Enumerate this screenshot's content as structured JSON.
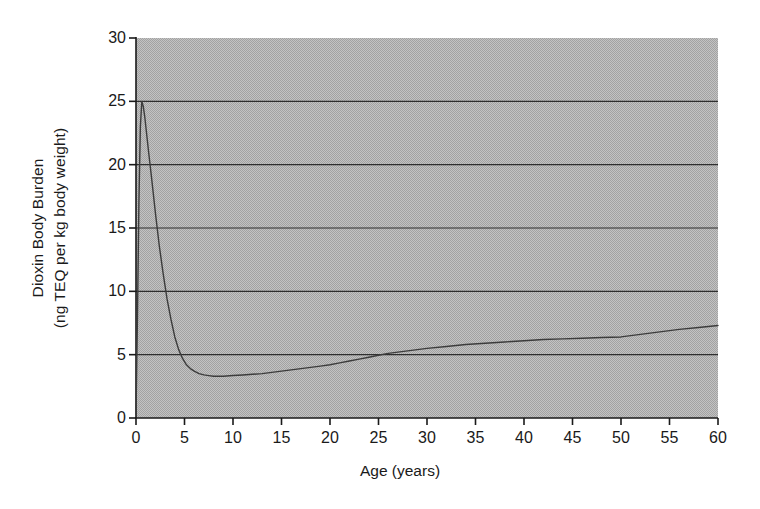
{
  "chart_data": {
    "type": "line",
    "title": "",
    "xlabel": "Age (years)",
    "ylabel_line1": "Dioxin Body Burden",
    "ylabel_line2": "(ng TEQ per kg body weight)",
    "xlim": [
      0,
      60
    ],
    "ylim": [
      0,
      30
    ],
    "xticks": [
      0,
      5,
      10,
      15,
      20,
      25,
      30,
      35,
      40,
      45,
      50,
      55,
      60
    ],
    "xtick_labels": [
      "0",
      "5",
      "10",
      "15",
      "20",
      "25",
      "30",
      "35",
      "40",
      "45",
      "50",
      "55",
      "60"
    ],
    "yticks": [
      0,
      5,
      10,
      15,
      20,
      25,
      30
    ],
    "ytick_labels": [
      "0",
      "5",
      "10",
      "15",
      "20",
      "25",
      "30"
    ],
    "gridlines": {
      "horizontal": [
        5,
        10,
        15,
        20,
        25
      ],
      "vertical": []
    },
    "plot_background": "#b3b3b3",
    "line_color": "#3c3c3c",
    "axis_color": "#1a1a1a",
    "legend": [],
    "series": [
      {
        "name": "Dioxin body burden",
        "x": [
          0.0,
          0.15,
          0.3,
          0.45,
          0.6,
          0.75,
          0.9,
          1.1,
          1.3,
          1.6,
          2.0,
          2.4,
          2.8,
          3.2,
          3.6,
          4.0,
          4.4,
          4.8,
          5.2,
          5.6,
          6.0,
          6.5,
          7.0,
          7.5,
          8.0,
          9.0,
          10.0,
          11.0,
          12.0,
          13.0,
          14.0,
          15.0,
          16.0,
          17.0,
          18.0,
          19.0,
          20.0,
          21.0,
          22.0,
          23.0,
          24.0,
          25.0,
          26.0,
          27.0,
          28.0,
          29.0,
          30.0,
          32.0,
          34.0,
          36.0,
          38.0,
          40.0,
          42.0,
          44.0,
          46.0,
          48.0,
          50.0,
          52.0,
          54.0,
          56.0,
          58.0,
          60.0
        ],
        "y": [
          0.3,
          8.0,
          17.0,
          23.0,
          25.0,
          24.6,
          23.8,
          22.4,
          21.0,
          19.0,
          16.2,
          13.6,
          11.4,
          9.4,
          7.8,
          6.4,
          5.4,
          4.7,
          4.2,
          3.9,
          3.7,
          3.5,
          3.4,
          3.35,
          3.3,
          3.3,
          3.35,
          3.4,
          3.45,
          3.5,
          3.6,
          3.7,
          3.8,
          3.9,
          4.0,
          4.1,
          4.2,
          4.35,
          4.5,
          4.65,
          4.8,
          4.95,
          5.1,
          5.2,
          5.3,
          5.4,
          5.5,
          5.65,
          5.8,
          5.9,
          6.0,
          6.1,
          6.2,
          6.25,
          6.3,
          6.35,
          6.4,
          6.6,
          6.8,
          7.0,
          7.15,
          7.3
        ]
      }
    ]
  },
  "geometry": {
    "plot_left": 136,
    "plot_right": 718,
    "plot_top": 38,
    "plot_bottom": 418
  }
}
